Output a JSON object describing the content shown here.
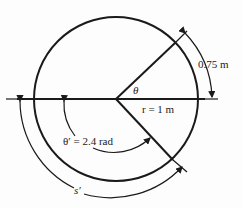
{
  "diagram": {
    "labels": {
      "theta": "θ",
      "radius": "r = 1 m",
      "arc_length": "0.75 m",
      "theta_prime": "θ′ = 2.4 rad",
      "s_prime": "s′"
    },
    "values": {
      "radius_m": 1,
      "arc_length_m": 0.75,
      "theta_prime_rad": 2.4
    },
    "stroke_color": "#1a1a1a"
  }
}
